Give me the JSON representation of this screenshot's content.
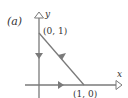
{
  "figure": {
    "panel_label": "(a)",
    "axes": {
      "x_label": "x",
      "y_label": "y"
    },
    "points": [
      {
        "id": "top",
        "label": "(0, 1)",
        "x": 0,
        "y": 1
      },
      {
        "id": "right",
        "label": "(1, 0)",
        "x": 1,
        "y": 0
      },
      {
        "id": "origin",
        "label": "",
        "x": 0,
        "y": 0
      }
    ],
    "path": {
      "description": "closed triangular contour traversed counterclockwise",
      "segments": [
        {
          "from": "origin",
          "to": "right",
          "direction": "right"
        },
        {
          "from": "right",
          "to": "top",
          "direction": "up-left"
        },
        {
          "from": "top",
          "to": "origin",
          "direction": "down"
        }
      ]
    },
    "colors": {
      "line": "#7a7a7a",
      "text": "#333333"
    }
  }
}
